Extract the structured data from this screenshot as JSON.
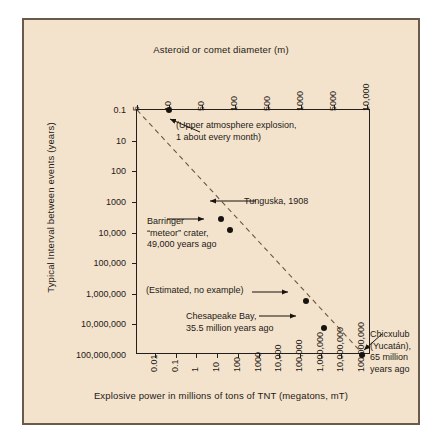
{
  "chart_data": {
    "type": "scatter",
    "title": "",
    "xlabel": "Explosive power in millions of tons of TNT (megatons, mT)",
    "ylabel": "Typical Interval between events (years)",
    "top_axis_label": "Asteroid or comet diameter (m)",
    "grid": false,
    "legend": "none",
    "x_scale": "log",
    "y_scale": "log",
    "xticks": [
      "0.01",
      "0.1",
      "1",
      "10",
      "100",
      "1000",
      "10,000",
      "100,000",
      "1,000,000",
      "10,000,000",
      "100,000,000"
    ],
    "yticks": [
      "0.1",
      "10",
      "100",
      "1000",
      "10,000",
      "100,000",
      "1,000,000",
      "10,000,000",
      "100,000,000"
    ],
    "top_xticks": [
      "5",
      "10",
      "50",
      "100",
      "500",
      "1000",
      "5000",
      "10,000"
    ],
    "points": [
      {
        "name": "upper-atmosphere-explosion",
        "x_mt": 0.05,
        "y_years": 0.1,
        "diameter_m": 10
      },
      {
        "name": "tunguska",
        "x_mt": 15,
        "y_years": 1000,
        "diameter_m": 60
      },
      {
        "name": "barringer",
        "x_mt": 40,
        "y_years": 2500,
        "diameter_m": 80
      },
      {
        "name": "estimated-no-example",
        "x_mt": 200000,
        "y_years": 1000000,
        "diameter_m": 1200
      },
      {
        "name": "chesapeake-bay",
        "x_mt": 1500000,
        "y_years": 10000000,
        "diameter_m": 2500
      },
      {
        "name": "chicxulub",
        "x_mt": 100000000,
        "y_years": 100000000,
        "diameter_m": 10000
      }
    ],
    "annotations": [
      {
        "name": "upper-atmosphere-explosion",
        "text": "(Upper atmosphere explosion,\n1 about every month)"
      },
      {
        "name": "tunguska",
        "text": "Tunguska, 1908"
      },
      {
        "name": "barringer",
        "text": "Barringer\n“meteor” crater,\n49,000 years ago"
      },
      {
        "name": "estimated-no-example",
        "text": "(Estimated, no example)"
      },
      {
        "name": "chesapeake-bay",
        "text": "Chesapeake Bay,\n35.5 million years ago"
      },
      {
        "name": "chicxulub",
        "text": "Chicxulub\n(Yucatán),\n65 million\nyears ago"
      }
    ],
    "colors": {
      "background": "#f4e3cc",
      "frame": "#231f1c",
      "text": "#1d1a17",
      "point": "#17130f",
      "trend_line": "#6b5344",
      "card_border": "#6b5a4a"
    }
  }
}
